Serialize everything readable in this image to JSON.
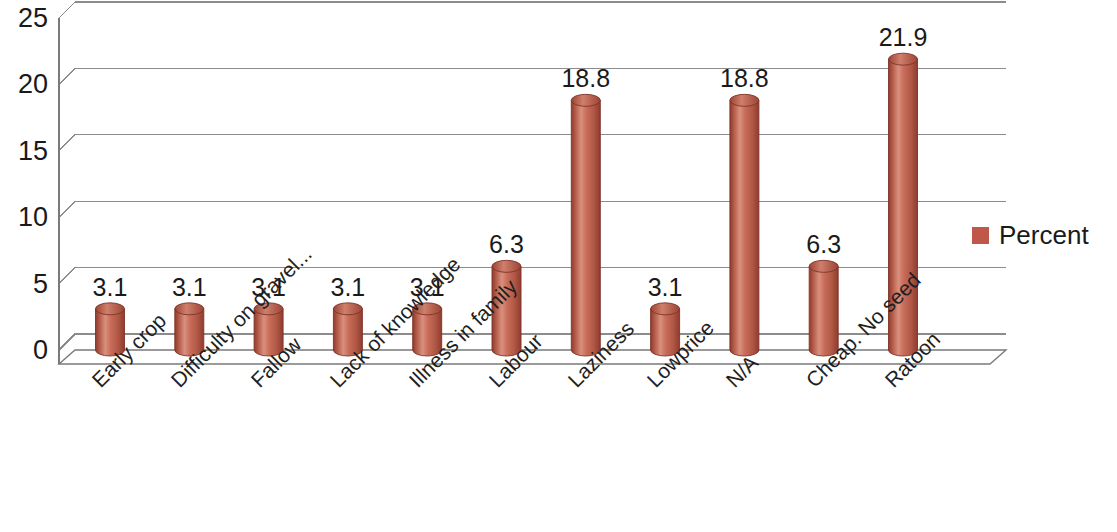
{
  "chart_data": {
    "type": "bar",
    "title": "",
    "subtitle": "",
    "xlabel": "",
    "ylabel": "",
    "ylim": [
      0,
      25
    ],
    "yticks": [
      "0",
      "5",
      "10",
      "15",
      "20",
      "25"
    ],
    "grid": true,
    "legend_position": "right",
    "style": "3d-cylinder",
    "categories": [
      "Early crop",
      "Difficulty on gravel...",
      "Fallow",
      "Lack of knowledge",
      "Illness in family",
      "Labour",
      "Laziness",
      "Lowprice",
      "N/A",
      "Cheap. No seed",
      "Ratoon"
    ],
    "series": [
      {
        "name": "Percent",
        "color": "#c0584a",
        "values": [
          3.1,
          3.1,
          3.1,
          3.1,
          3.1,
          6.3,
          18.8,
          3.1,
          18.8,
          6.3,
          21.9
        ],
        "value_labels": [
          "3.1",
          "3.1",
          "3.1",
          "3.1",
          "3.1",
          "6.3",
          "18.8",
          "3.1",
          "18.8",
          "6.3",
          "21.9"
        ]
      }
    ]
  },
  "legend": {
    "entries": [
      {
        "label": "Percent",
        "color": "#c0584a"
      }
    ]
  },
  "axis": {
    "y_tick_labels": [
      "25",
      "20",
      "15",
      "10",
      "5",
      "0"
    ]
  },
  "colors": {
    "bar_fill": "#c0584a",
    "bar_dark": "#8e3b2f",
    "bar_light": "#d98a78",
    "gridline": "#8c8c8c",
    "axis_line": "#7a7a7a",
    "text": "#1a1a1a",
    "background": "#ffffff"
  }
}
